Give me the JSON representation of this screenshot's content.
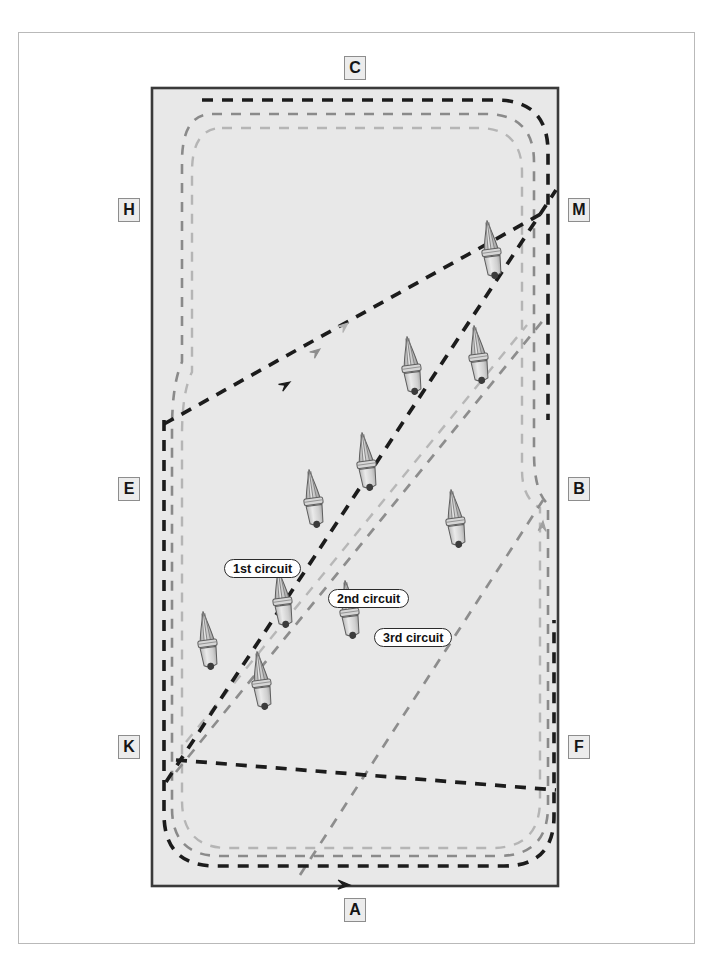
{
  "diagram": {
    "arena": {
      "fill": "#e8e8e8",
      "stroke": "#3a3a3a",
      "x": 152,
      "y": 88,
      "width": 406,
      "height": 798
    },
    "frame": {
      "stroke": "#b9b9b9"
    }
  },
  "markers": [
    {
      "letter": "C",
      "position": "top-center",
      "x": 344,
      "y": 56
    },
    {
      "letter": "A",
      "position": "bottom-center",
      "x": 344,
      "y": 898
    },
    {
      "letter": "H",
      "position": "left-upper",
      "x": 118,
      "y": 198
    },
    {
      "letter": "E",
      "position": "left-center",
      "x": 118,
      "y": 477
    },
    {
      "letter": "K",
      "position": "left-lower",
      "x": 118,
      "y": 735
    },
    {
      "letter": "M",
      "position": "right-upper",
      "x": 568,
      "y": 198
    },
    {
      "letter": "B",
      "position": "right-center",
      "x": 568,
      "y": 477
    },
    {
      "letter": "F",
      "position": "right-lower",
      "x": 568,
      "y": 735
    }
  ],
  "circuits": [
    {
      "id": 1,
      "label": "1st circuit",
      "color": "#1c1c1c",
      "dash": "11 9",
      "width": 3.6,
      "label_x": 224,
      "label_y": 559
    },
    {
      "id": 2,
      "label": "2nd circuit",
      "color": "#8a8a8a",
      "dash": "10 9",
      "width": 2.6,
      "label_x": 328,
      "label_y": 589
    },
    {
      "id": 3,
      "label": "3rd circuit",
      "color": "#b5b5b5",
      "dash": "10 9",
      "width": 2.4,
      "label_x": 374,
      "label_y": 628
    }
  ],
  "cones": [
    {
      "id": 1,
      "x": 492,
      "y": 256,
      "scale": 1.0
    },
    {
      "id": 2,
      "x": 412,
      "y": 372,
      "scale": 1.0
    },
    {
      "id": 3,
      "x": 479,
      "y": 361,
      "scale": 1.0
    },
    {
      "id": 4,
      "x": 367,
      "y": 468,
      "scale": 1.0
    },
    {
      "id": 5,
      "x": 456,
      "y": 525,
      "scale": 1.0
    },
    {
      "id": 6,
      "x": 314,
      "y": 505,
      "scale": 1.0
    },
    {
      "id": 7,
      "x": 283,
      "y": 605,
      "scale": 1.0
    },
    {
      "id": 8,
      "x": 350,
      "y": 616,
      "scale": 1.0
    },
    {
      "id": 9,
      "x": 208,
      "y": 647,
      "scale": 1.0
    },
    {
      "id": 10,
      "x": 262,
      "y": 687,
      "scale": 1.0
    }
  ],
  "arrows": [
    {
      "on_circuit": 1,
      "x": 288,
      "y": 382,
      "angle": 132
    },
    {
      "on_circuit": 2,
      "x": 318,
      "y": 348,
      "angle": 145
    },
    {
      "on_circuit": 3,
      "x": 345,
      "y": 322,
      "angle": 155
    },
    {
      "on_circuit": 3,
      "x": 541,
      "y": 517,
      "angle": 95
    },
    {
      "on_circuit": 1,
      "x": 357,
      "y": 884,
      "angle": 182
    }
  ]
}
